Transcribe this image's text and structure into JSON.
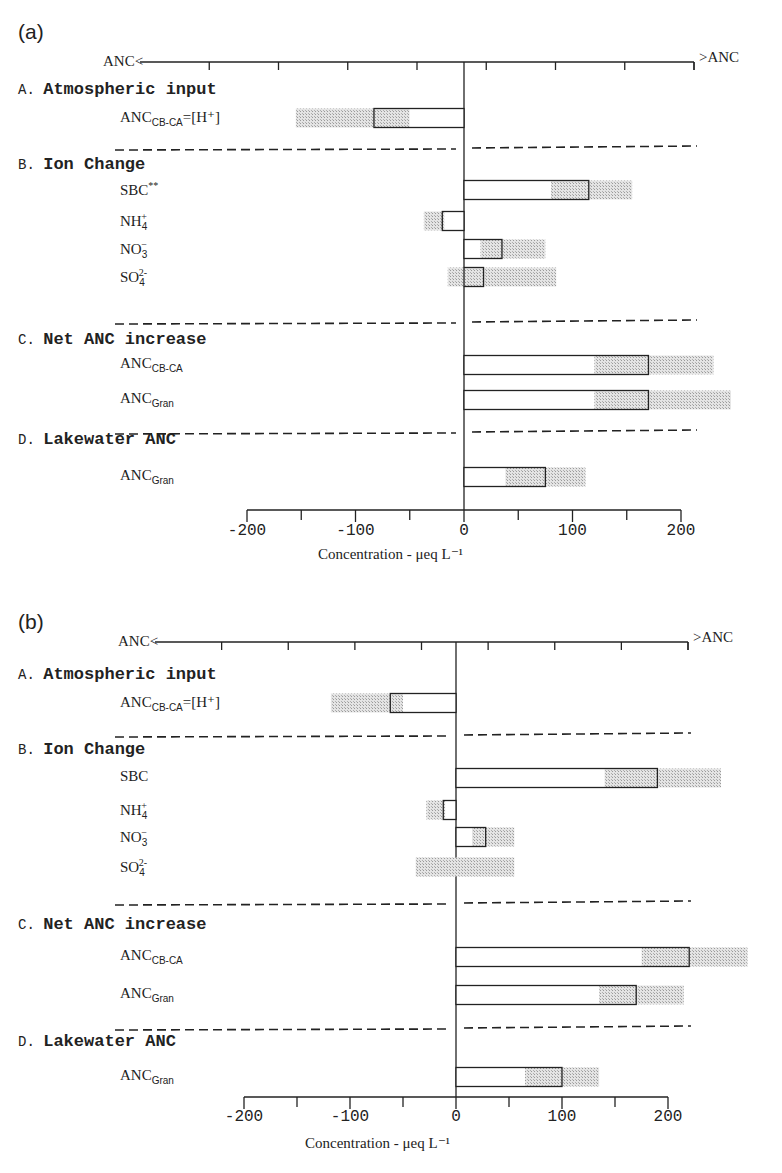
{
  "figure": {
    "panels": [
      {
        "label": "(a)",
        "top_axis_left": "ANC<",
        "top_axis_right": ">ANC",
        "xlabel": "Concentration - μeq L⁻¹",
        "ticks": [
          "-200",
          "-100",
          "0",
          "100",
          "200"
        ],
        "sections": [
          {
            "letter": "A.",
            "name": "Atmospheric input",
            "rows": [
              {
                "label": "ANC",
                "sub": "CB-CA",
                "suffix": "=[H⁺]"
              }
            ]
          },
          {
            "letter": "B.",
            "name": "Ion Change",
            "rows": [
              {
                "label": "SBC",
                "sup": "**"
              },
              {
                "label": "NH",
                "sub": "4",
                "sup": "+"
              },
              {
                "label": "NO",
                "sub": "3",
                "sup": "−"
              },
              {
                "label": "SO",
                "sub": "4",
                "sup": "2-"
              }
            ]
          },
          {
            "letter": "C.",
            "name": "Net ANC increase",
            "rows": [
              {
                "label": "ANC",
                "sub": "CB-CA"
              },
              {
                "label": "ANC",
                "sub": "Gran"
              }
            ]
          },
          {
            "letter": "D.",
            "name": "Lakewater ANC",
            "rows": [
              {
                "label": "ANC",
                "sub": "Gran"
              }
            ]
          }
        ]
      },
      {
        "label": "(b)",
        "top_axis_left": "ANC<",
        "top_axis_right": ">ANC",
        "xlabel": "Concentration - μeq L⁻¹",
        "ticks": [
          "-200",
          "-100",
          "0",
          "100",
          "200"
        ],
        "sections": [
          {
            "letter": "A.",
            "name": "Atmospheric input",
            "rows": [
              {
                "label": "ANC",
                "sub": "CB-CA",
                "suffix": "=[H⁺]"
              }
            ]
          },
          {
            "letter": "B.",
            "name": "Ion Change",
            "rows": [
              {
                "label": "SBC"
              },
              {
                "label": "NH",
                "sub": "4",
                "sup": "+"
              },
              {
                "label": "NO",
                "sub": "3",
                "sup": "−"
              },
              {
                "label": "SO",
                "sub": "4",
                "sup": "2-"
              }
            ]
          },
          {
            "letter": "C.",
            "name": "Net ANC increase",
            "rows": [
              {
                "label": "ANC",
                "sub": "CB-CA"
              },
              {
                "label": "ANC",
                "sub": "Gran"
              }
            ]
          },
          {
            "letter": "D.",
            "name": "Lakewater ANC",
            "rows": [
              {
                "label": "ANC",
                "sub": "Gran"
              }
            ]
          }
        ]
      }
    ]
  },
  "chart_data": [
    {
      "type": "bar",
      "title": "(a)",
      "orientation": "horizontal",
      "xlabel": "Concentration - μeq L⁻¹",
      "xlim": [
        -200,
        200
      ],
      "xticks": [
        -200,
        -100,
        0,
        100,
        200
      ],
      "top_axis": {
        "left": "ANC<",
        "right": ">ANC"
      },
      "grid": false,
      "categories": [
        "A. ANC CB-CA=[H+]",
        "B. SBC**",
        "B. NH4+",
        "B. NO3-",
        "B. SO4 2-",
        "C. ANC CB-CA",
        "C. ANC Gran",
        "D. ANC Gran"
      ],
      "values": [
        -83,
        115,
        -20,
        35,
        18,
        170,
        170,
        75
      ],
      "range_low": [
        -155,
        80,
        -37,
        15,
        -15,
        120,
        120,
        38
      ],
      "range_high": [
        -50,
        155,
        -18,
        75,
        85,
        230,
        246,
        112
      ],
      "series_note": "Open box = mean value; stippled band = range/uncertainty"
    },
    {
      "type": "bar",
      "title": "(b)",
      "orientation": "horizontal",
      "xlabel": "Concentration - μeq L⁻¹",
      "xlim": [
        -200,
        200
      ],
      "xticks": [
        -200,
        -100,
        0,
        100,
        200
      ],
      "top_axis": {
        "left": "ANC<",
        "right": ">ANC"
      },
      "grid": false,
      "categories": [
        "A. ANC CB-CA=[H+]",
        "B. SBC",
        "B. NH4+",
        "B. NO3-",
        "B. SO4 2-",
        "C. ANC CB-CA",
        "C. ANC Gran",
        "D. ANC Gran"
      ],
      "values": [
        -62,
        190,
        -12,
        28,
        0,
        220,
        170,
        100
      ],
      "range_low": [
        -118,
        140,
        -28,
        15,
        -38,
        175,
        135,
        65
      ],
      "range_high": [
        -50,
        250,
        -10,
        55,
        55,
        275,
        215,
        135
      ],
      "series_note": "Open box = mean value; stippled band = range/uncertainty"
    }
  ],
  "layout": {
    "panels": [
      {
        "top": 0,
        "x0": 464,
        "scale": 1.085,
        "axis_y": 62,
        "bottom_axis_y": 510,
        "left_end": 140,
        "right_end": 694,
        "section_y": [
          90,
          165,
          340,
          440
        ],
        "row_y": [
          [
            118
          ],
          [
            190,
            221,
            249,
            277
          ],
          [
            365,
            400
          ],
          [
            477
          ]
        ],
        "divider_y": [
          148,
          322,
          432
        ],
        "xlabel_y": 545,
        "tick_label_y": 535,
        "xlabel_x": 318,
        "label_y": 20
      },
      {
        "top": 585,
        "x0": 456,
        "scale": 1.06,
        "axis_y": 57,
        "bottom_axis_y": 512,
        "left_end": 155,
        "right_end": 688,
        "section_y": [
          90,
          165,
          340,
          457
        ],
        "row_y": [
          [
            118
          ],
          [
            193,
            225,
            252,
            282
          ],
          [
            372,
            410
          ],
          [
            492
          ]
        ],
        "divider_y": [
          150,
          318,
          443
        ],
        "xlabel_y": 549,
        "tick_label_y": 536,
        "xlabel_x": 305,
        "label_y": 25
      }
    ]
  }
}
